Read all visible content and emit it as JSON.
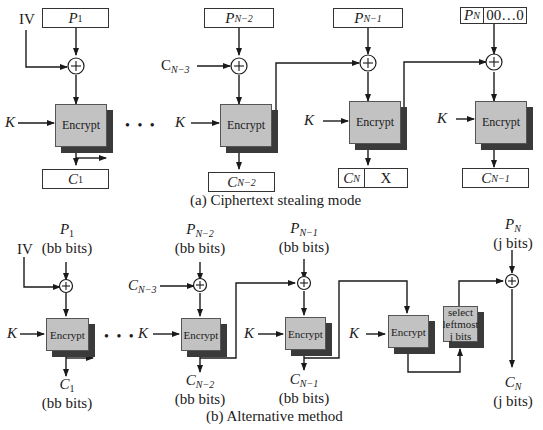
{
  "diagram": {
    "panel_a": {
      "caption": "(a) Ciphertext stealing mode",
      "iv_label": "IV",
      "key_label": "K",
      "ellipsis": "• • •",
      "encrypt_label": "Encrypt",
      "inputs": [
        {
          "base": "P",
          "sub": "1"
        },
        {
          "base": "P",
          "sub": "N−2"
        },
        {
          "base": "P",
          "sub": "N−1"
        },
        {
          "base": "P",
          "sub": "N",
          "padding": "00…0"
        }
      ],
      "chain_input": {
        "base": "C",
        "sub": "N−3"
      },
      "outputs": [
        {
          "base": "C",
          "sub": "1"
        },
        {
          "base": "C",
          "sub": "N−2"
        },
        {
          "base": "C",
          "sub": "N",
          "extra": "X"
        },
        {
          "base": "C",
          "sub": "N−1"
        }
      ]
    },
    "panel_b": {
      "caption": "(b) Alternative method",
      "iv_label": "IV",
      "key_label": "K",
      "ellipsis": "• • •",
      "encrypt_label": "Encrypt",
      "select_label": [
        "select",
        "leftmost",
        "j bits"
      ],
      "inputs": [
        {
          "base": "P",
          "sub": "1",
          "size": "(bb bits)"
        },
        {
          "base": "P",
          "sub": "N−2",
          "size": "(bb bits)"
        },
        {
          "base": "P",
          "sub": "N−1",
          "size": "(bb bits)"
        },
        {
          "base": "P",
          "sub": "N",
          "size": "(j bits)"
        }
      ],
      "chain_input": {
        "base": "C",
        "sub": "N−3"
      },
      "outputs": [
        {
          "base": "C",
          "sub": "1",
          "size": "(bb bits)"
        },
        {
          "base": "C",
          "sub": "N−2",
          "size": "(bb bits)"
        },
        {
          "base": "C",
          "sub": "N−1",
          "size": "(bb bits)"
        },
        {
          "base": "C",
          "sub": "N",
          "size": "(j bits)"
        }
      ]
    },
    "colors": {
      "encrypt_fill": "#c2c2c2",
      "encrypt_shadow": "#3a3a3a",
      "line": "#1a1a1a"
    }
  }
}
